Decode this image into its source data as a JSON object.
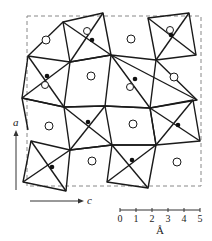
{
  "figure": {
    "type": "crystal-structure-projection",
    "stroke_color": "#1a1a1a",
    "dashed_color": "#888888",
    "axes": {
      "vertical_label": "a",
      "horizontal_label": "c"
    },
    "scale_bar": {
      "ticks": [
        "0",
        "1",
        "2",
        "3",
        "4",
        "5"
      ],
      "unit": "Å"
    },
    "legend_symbols": {
      "open_circle": "open-circle-atom",
      "filled_dot": "filled-dot-atom"
    }
  }
}
